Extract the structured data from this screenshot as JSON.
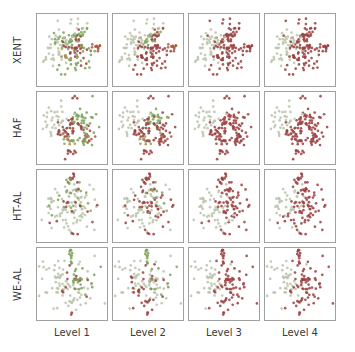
{
  "figure": {
    "background": "#ffffff",
    "panel_border_color": "#a0a0a0",
    "label_color": "#3a3a3a"
  },
  "rows": [
    {
      "label": "XENT"
    },
    {
      "label": "HAF"
    },
    {
      "label": "HT-AL"
    },
    {
      "label": "WE-AL"
    }
  ],
  "columns": [
    {
      "label": "Level 1"
    },
    {
      "label": "Level 2"
    },
    {
      "label": "Level 3"
    },
    {
      "label": "Level 4"
    }
  ],
  "palette": {
    "R": "#9c4444",
    "G": "#7da65c",
    "S": "#bcc5ac",
    "O": "#a49a58",
    "M": "#a95e49"
  },
  "chart_data": {
    "type": "scatter",
    "layout": "4x4 small multiples; rows are methods (XENT, HAF, HT-AL, WE-AL), columns are hierarchy Levels 1-4; point positions are shared across the columns of a row while point colors merge into two classes (dark red vs pale sage) at higher levels",
    "rows": [
      "XENT",
      "HAF",
      "HT-AL",
      "WE-AL"
    ],
    "columns": [
      "Level 1",
      "Level 2",
      "Level 3",
      "Level 4"
    ],
    "axes": {
      "ticks": false,
      "axis_labels": false,
      "grid": false
    },
    "marker_radius": 1.9,
    "marker_opacity": 0.88,
    "seed_base": 7,
    "row_clusters": {
      "XENT": [
        {
          "cx": 24,
          "cy": 46,
          "sx": 9,
          "sy": 12,
          "n": 24,
          "colors": [
            "S",
            "S",
            "S",
            "S"
          ]
        },
        {
          "cx": 38,
          "cy": 36,
          "sx": 8,
          "sy": 8,
          "n": 16,
          "colors": [
            "G",
            "S",
            "S",
            "S"
          ]
        },
        {
          "cx": 56,
          "cy": 33,
          "sx": 9,
          "sy": 8,
          "n": 24,
          "colors": [
            "G",
            "G",
            "R",
            "R"
          ]
        },
        {
          "cx": 58,
          "cy": 50,
          "sx": 10,
          "sy": 9,
          "n": 32,
          "colors": [
            "R",
            "R",
            "R",
            "R"
          ]
        },
        {
          "cx": 47,
          "cy": 61,
          "sx": 8,
          "sy": 7,
          "n": 14,
          "colors": [
            "O",
            "R",
            "R",
            "R"
          ]
        },
        {
          "cx": 57,
          "cy": 74,
          "sx": 12,
          "sy": 7,
          "n": 12,
          "colors": [
            "G",
            "R",
            "R",
            "R"
          ]
        },
        {
          "cx": 86,
          "cy": 46,
          "sx": 3.5,
          "sy": 4.5,
          "n": 13,
          "colors": [
            "M",
            "M",
            "R",
            "R"
          ]
        },
        {
          "cx": 30,
          "cy": 55,
          "sx": 10,
          "sy": 14,
          "n": 13,
          "colors": [
            "S",
            "S",
            "S",
            "S"
          ]
        },
        {
          "cx": 70,
          "cy": 42,
          "sx": 10,
          "sy": 16,
          "n": 14,
          "colors": [
            "G",
            "R",
            "R",
            "R"
          ]
        },
        {
          "cx": 50,
          "cy": 16,
          "sx": 14,
          "sy": 6,
          "n": 10,
          "colors": [
            "S",
            "S",
            "R",
            "R"
          ]
        }
      ],
      "HAF": [
        {
          "cx": 24,
          "cy": 44,
          "sx": 9,
          "sy": 12,
          "n": 22,
          "colors": [
            "S",
            "S",
            "S",
            "S"
          ]
        },
        {
          "cx": 55,
          "cy": 37,
          "sx": 10,
          "sy": 8,
          "n": 24,
          "colors": [
            "G",
            "G",
            "R",
            "R"
          ]
        },
        {
          "cx": 52,
          "cy": 52,
          "sx": 10,
          "sy": 8,
          "n": 26,
          "colors": [
            "R",
            "R",
            "R",
            "R"
          ]
        },
        {
          "cx": 35,
          "cy": 56,
          "sx": 6,
          "sy": 6,
          "n": 10,
          "colors": [
            "R",
            "R",
            "R",
            "R"
          ]
        },
        {
          "cx": 47,
          "cy": 70,
          "sx": 6,
          "sy": 5,
          "n": 10,
          "colors": [
            "O",
            "O",
            "R",
            "R"
          ]
        },
        {
          "cx": 71,
          "cy": 67,
          "sx": 4.5,
          "sy": 4.5,
          "n": 12,
          "colors": [
            "M",
            "M",
            "R",
            "R"
          ]
        },
        {
          "cx": 50,
          "cy": 84,
          "sx": 5,
          "sy": 4,
          "n": 8,
          "colors": [
            "R",
            "R",
            "R",
            "R"
          ]
        },
        {
          "cx": 52,
          "cy": 7,
          "sx": 2,
          "sy": 2,
          "n": 3,
          "colors": [
            "R",
            "R",
            "R",
            "R"
          ]
        },
        {
          "cx": 31,
          "cy": 35,
          "sx": 10,
          "sy": 10,
          "n": 12,
          "colors": [
            "S",
            "S",
            "S",
            "S"
          ]
        },
        {
          "cx": 70,
          "cy": 40,
          "sx": 10,
          "sy": 14,
          "n": 14,
          "colors": [
            "G",
            "R",
            "R",
            "R"
          ]
        },
        {
          "cx": 60,
          "cy": 62,
          "sx": 12,
          "sy": 8,
          "n": 10,
          "colors": [
            "G",
            "R",
            "R",
            "R"
          ]
        }
      ],
      "HT-AL": [
        {
          "cx": 32,
          "cy": 50,
          "sx": 12,
          "sy": 15,
          "n": 30,
          "colors": [
            "S",
            "S",
            "S",
            "S"
          ]
        },
        {
          "cx": 38,
          "cy": 44,
          "sx": 11,
          "sy": 13,
          "n": 12,
          "colors": [
            "G",
            "R",
            "S",
            "S"
          ]
        },
        {
          "cx": 62,
          "cy": 50,
          "sx": 13,
          "sy": 15,
          "n": 20,
          "colors": [
            "S",
            "R",
            "R",
            "R"
          ]
        },
        {
          "cx": 60,
          "cy": 48,
          "sx": 13,
          "sy": 15,
          "n": 18,
          "colors": [
            "S",
            "S",
            "R",
            "R"
          ]
        },
        {
          "cx": 58,
          "cy": 42,
          "sx": 11,
          "sy": 12,
          "n": 12,
          "colors": [
            "G",
            "G",
            "R",
            "R"
          ]
        },
        {
          "cx": 54,
          "cy": 55,
          "sx": 16,
          "sy": 15,
          "n": 14,
          "colors": [
            "R",
            "R",
            "R",
            "R"
          ]
        },
        {
          "cx": 50,
          "cy": 10,
          "sx": 3.5,
          "sy": 4,
          "n": 9,
          "colors": [
            "R",
            "R",
            "R",
            "R"
          ]
        },
        {
          "cx": 46,
          "cy": 14,
          "sx": 3,
          "sy": 3,
          "n": 4,
          "colors": [
            "G",
            "R",
            "R",
            "R"
          ]
        },
        {
          "cx": 50,
          "cy": 90,
          "sx": 3,
          "sy": 2,
          "n": 2,
          "colors": [
            "R",
            "R",
            "R",
            "R"
          ]
        },
        {
          "cx": 45,
          "cy": 70,
          "sx": 14,
          "sy": 8,
          "n": 12,
          "colors": [
            "S",
            "S",
            "S",
            "R"
          ]
        }
      ],
      "WE-AL": [
        {
          "cx": 50,
          "cy": 10,
          "sx": 3.5,
          "sy": 5,
          "n": 12,
          "colors": [
            "G",
            "G",
            "R",
            "R"
          ]
        },
        {
          "cx": 31,
          "cy": 48,
          "sx": 12,
          "sy": 14,
          "n": 28,
          "colors": [
            "S",
            "S",
            "S",
            "S"
          ]
        },
        {
          "cx": 35,
          "cy": 52,
          "sx": 13,
          "sy": 14,
          "n": 10,
          "colors": [
            "S",
            "R",
            "S",
            "S"
          ]
        },
        {
          "cx": 63,
          "cy": 50,
          "sx": 13,
          "sy": 15,
          "n": 22,
          "colors": [
            "S",
            "S",
            "R",
            "R"
          ]
        },
        {
          "cx": 58,
          "cy": 42,
          "sx": 8,
          "sy": 7,
          "n": 14,
          "colors": [
            "G",
            "S",
            "R",
            "R"
          ]
        },
        {
          "cx": 60,
          "cy": 52,
          "sx": 14,
          "sy": 14,
          "n": 12,
          "colors": [
            "R",
            "R",
            "R",
            "R"
          ]
        },
        {
          "cx": 62,
          "cy": 45,
          "sx": 12,
          "sy": 12,
          "n": 10,
          "colors": [
            "G",
            "G",
            "R",
            "R"
          ]
        },
        {
          "cx": 52,
          "cy": 78,
          "sx": 7,
          "sy": 6,
          "n": 10,
          "colors": [
            "S",
            "R",
            "R",
            "R"
          ]
        },
        {
          "cx": 48,
          "cy": 93,
          "sx": 2,
          "sy": 2,
          "n": 2,
          "colors": [
            "R",
            "R",
            "R",
            "R"
          ]
        },
        {
          "cx": 25,
          "cy": 30,
          "sx": 8,
          "sy": 8,
          "n": 8,
          "colors": [
            "S",
            "S",
            "S",
            "S"
          ]
        }
      ]
    }
  }
}
